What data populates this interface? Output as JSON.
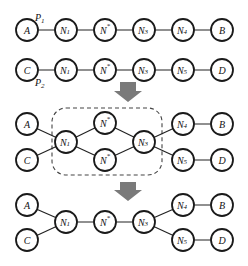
{
  "diagram": {
    "title": "",
    "stage1": {
      "paths": [
        {
          "label": "P",
          "label_sub": "1",
          "nodes": [
            {
              "base": "A",
              "sub": "",
              "sup": ""
            },
            {
              "base": "N",
              "sub": "1",
              "sup": ""
            },
            {
              "base": "N",
              "sub": "",
              "sup": "*"
            },
            {
              "base": "N",
              "sub": "3",
              "sup": ""
            },
            {
              "base": "N",
              "sub": "4",
              "sup": ""
            },
            {
              "base": "B",
              "sub": "",
              "sup": ""
            }
          ]
        },
        {
          "label": "P",
          "label_sub": "2",
          "nodes": [
            {
              "base": "C",
              "sub": "",
              "sup": ""
            },
            {
              "base": "N",
              "sub": "1",
              "sup": ""
            },
            {
              "base": "N",
              "sub": "",
              "sup": "*"
            },
            {
              "base": "N",
              "sub": "3",
              "sup": ""
            },
            {
              "base": "N",
              "sub": "5",
              "sup": ""
            },
            {
              "base": "D",
              "sub": "",
              "sup": ""
            }
          ]
        }
      ]
    },
    "stage2": {
      "nodes": {
        "A": {
          "base": "A",
          "sub": "",
          "sup": ""
        },
        "C": {
          "base": "C",
          "sub": "",
          "sup": ""
        },
        "N1": {
          "base": "N",
          "sub": "1",
          "sup": ""
        },
        "Nstar_top": {
          "base": "N",
          "sub": "",
          "sup": "*"
        },
        "Nstar_bottom": {
          "base": "N",
          "sub": "",
          "sup": "*"
        },
        "N3": {
          "base": "N",
          "sub": "3",
          "sup": ""
        },
        "N4": {
          "base": "N",
          "sub": "4",
          "sup": ""
        },
        "N5": {
          "base": "N",
          "sub": "5",
          "sup": ""
        },
        "B": {
          "base": "B",
          "sub": "",
          "sup": ""
        },
        "D": {
          "base": "D",
          "sub": "",
          "sup": ""
        }
      },
      "highlight": "dashed rounded box around N1, N*, N*, N3"
    },
    "stage3": {
      "nodes": {
        "A": {
          "base": "A",
          "sub": "",
          "sup": ""
        },
        "C": {
          "base": "C",
          "sub": "",
          "sup": ""
        },
        "N1": {
          "base": "N",
          "sub": "1",
          "sup": ""
        },
        "Nstar": {
          "base": "N",
          "sub": "",
          "sup": "*"
        },
        "N3": {
          "base": "N",
          "sub": "3",
          "sup": ""
        },
        "N4": {
          "base": "N",
          "sub": "4",
          "sup": ""
        },
        "N5": {
          "base": "N",
          "sub": "5",
          "sup": ""
        },
        "B": {
          "base": "B",
          "sub": "",
          "sup": ""
        },
        "D": {
          "base": "D",
          "sub": "",
          "sup": ""
        }
      }
    },
    "colors": {
      "arrow": "#7a7a7a",
      "stroke": "#1a1a1a",
      "background": "#ffffff"
    }
  }
}
